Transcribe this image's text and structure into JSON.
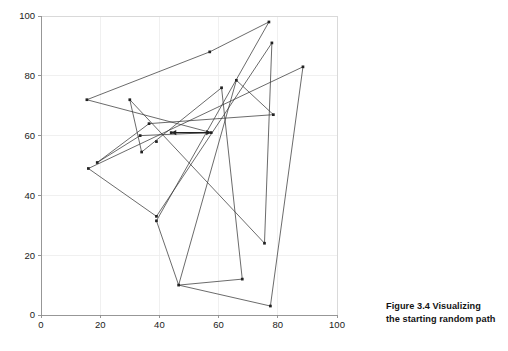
{
  "caption": {
    "number": "Figure 3.4",
    "text": "Visualizing the starting random path",
    "line1_label": "Figure 3.4   Visualizing",
    "line2_label": "the starting random path"
  },
  "chart_data": {
    "type": "line",
    "title": "",
    "subtitle": "",
    "xlabel": "",
    "ylabel": "",
    "xlim": [
      0,
      100
    ],
    "ylim": [
      0,
      100
    ],
    "xticks": [
      0,
      20,
      40,
      60,
      80,
      100
    ],
    "yticks": [
      0,
      20,
      40,
      60,
      80,
      100
    ],
    "xtick_labels": [
      "0",
      "20",
      "40",
      "60",
      "80",
      "100"
    ],
    "ytick_labels": [
      "0",
      "20",
      "40",
      "60",
      "80",
      "100"
    ],
    "grid": true,
    "legend": "none",
    "marker": "point",
    "line_color": "#3a3a3a",
    "marker_color": "#222222",
    "grid_color": "#ececec",
    "axis_color": "#8c8c8c",
    "background": "#ffffff",
    "series": [
      {
        "name": "random path",
        "closed": true,
        "x": [
          15.5,
          57.0,
          77.0,
          39.0,
          46.5,
          77.5,
          88.5,
          16.0,
          39.0,
          78.0,
          75.5,
          30.0,
          34.0,
          61.0,
          68.0,
          46.5,
          66.0,
          78.5,
          36.5,
          19.0,
          33.5,
          57.5
        ],
        "y": [
          72.0,
          88.0,
          98.0,
          31.5,
          10.0,
          3.0,
          83.0,
          49.0,
          33.0,
          91.0,
          24.0,
          72.0,
          54.5,
          76.0,
          12.0,
          10.0,
          78.5,
          67.0,
          64.0,
          51.0,
          60.0,
          61.0
        ]
      }
    ],
    "points": [
      {
        "x": 15.5,
        "y": 72.0
      },
      {
        "x": 57.0,
        "y": 88.0
      },
      {
        "x": 77.0,
        "y": 98.0
      },
      {
        "x": 39.0,
        "y": 31.5
      },
      {
        "x": 46.5,
        "y": 10.0
      },
      {
        "x": 77.5,
        "y": 3.0
      },
      {
        "x": 88.5,
        "y": 83.0
      },
      {
        "x": 16.0,
        "y": 49.0
      },
      {
        "x": 39.0,
        "y": 33.0
      },
      {
        "x": 78.0,
        "y": 91.0
      },
      {
        "x": 75.5,
        "y": 24.0
      },
      {
        "x": 30.0,
        "y": 72.0
      },
      {
        "x": 34.0,
        "y": 54.5
      },
      {
        "x": 61.0,
        "y": 76.0
      },
      {
        "x": 68.0,
        "y": 12.0
      },
      {
        "x": 66.0,
        "y": 78.5
      },
      {
        "x": 78.5,
        "y": 67.0
      },
      {
        "x": 36.5,
        "y": 64.0
      },
      {
        "x": 19.0,
        "y": 51.0
      },
      {
        "x": 33.5,
        "y": 60.0
      },
      {
        "x": 39.0,
        "y": 58.0
      },
      {
        "x": 44.0,
        "y": 61.0
      },
      {
        "x": 57.5,
        "y": 61.0
      }
    ],
    "annotations": [
      {
        "kind": "double-arrow-segment",
        "x1": 44.0,
        "y1": 61.0,
        "x2": 57.5,
        "y2": 61.0
      }
    ],
    "plot_box": {
      "left": 41,
      "top": 16,
      "right": 337,
      "bottom": 315
    }
  }
}
